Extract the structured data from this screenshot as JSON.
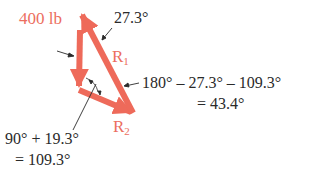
{
  "diagram": {
    "colors": {
      "vector": "#ee6a5a",
      "vector_label": "#ec6e5e",
      "text": "#2a2a2a"
    },
    "vectors": [
      {
        "name": "400 lb",
        "label": "400 lb"
      },
      {
        "name": "R1",
        "label": "R",
        "subscript": "1"
      },
      {
        "name": "R2",
        "label": "R",
        "subscript": "2"
      }
    ],
    "annotations": {
      "angle_top": "27.3°",
      "angle_right_line1": "180° – 27.3° – 109.3°",
      "angle_right_line2": "= 43.4°",
      "angle_bottom_line1": "90° + 19.3°",
      "angle_bottom_line2": "= 109.3°"
    }
  }
}
